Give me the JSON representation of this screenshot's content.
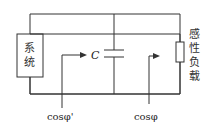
{
  "diagram": {
    "system_label_line1": "系",
    "system_label_line2": "统",
    "capacitor_label": "C",
    "load_label": [
      "感",
      "性",
      "负",
      "载"
    ],
    "pf_before": "cosφ'",
    "pf_after": "cosφ",
    "colors": {
      "line": "#333333",
      "background": "#ffffff"
    }
  }
}
